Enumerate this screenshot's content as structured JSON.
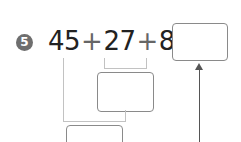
{
  "problem": {
    "number": "5",
    "terms": [
      "45",
      "27",
      "8"
    ],
    "operators": [
      "+",
      "+"
    ],
    "equals": "="
  },
  "answer_boxes": [
    {
      "id": "final-answer",
      "value": ""
    },
    {
      "id": "partial-27-plus-8",
      "value": ""
    },
    {
      "id": "partial-45-plus-sum",
      "value": ""
    }
  ]
}
